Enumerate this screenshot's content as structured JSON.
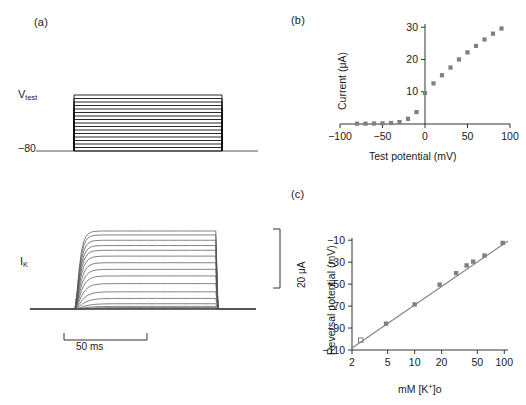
{
  "figure": {
    "panel_a": {
      "label": "(a)",
      "voltage_trace_label_main": "V",
      "voltage_trace_label_sub": "test",
      "holding_label": "−80",
      "current_trace_label_main": "I",
      "current_trace_label_sub": "K",
      "time_scale_label": "50 ms",
      "current_scale_label": "20 μA"
    },
    "panel_b": {
      "label": "(b)"
    },
    "panel_c": {
      "label": "(c)"
    }
  },
  "chart_data": [
    {
      "id": "voltage-protocol",
      "type": "line",
      "title": "Voltage-clamp step protocol",
      "xlabel": "",
      "ylabel": "",
      "holding_potential": -80,
      "n_steps": 17,
      "step_start_mv": -80,
      "step_end_mv": 80,
      "step_increment_mv": 10,
      "ylim": [
        -90,
        90
      ],
      "grid": false,
      "legend": "none"
    },
    {
      "id": "potassium-current-traces",
      "type": "line",
      "title": "Delayed rectifier K+ current families",
      "xlabel": "",
      "ylabel": "",
      "time_scale_bar_ms": 50,
      "current_scale_bar_ua": 20,
      "n_traces": 17,
      "trace_steady_state_ua": [
        0.0,
        0.1,
        0.2,
        0.3,
        0.5,
        1.0,
        2.0,
        4.0,
        6.5,
        9.6,
        12.5,
        15.0,
        17.5,
        20.0,
        22.2,
        24.0,
        26.0,
        28.0,
        29.5
      ],
      "grid": false,
      "legend": "none"
    },
    {
      "id": "current-voltage-relation",
      "type": "scatter",
      "title": "",
      "xlabel": "Test potential (mV)",
      "ylabel": "Current (μA)",
      "xlim": [
        -100,
        100
      ],
      "ylim": [
        0,
        31
      ],
      "xticks": [
        -100,
        -50,
        0,
        50,
        100
      ],
      "xticklabels": [
        "−100",
        "−50",
        "0",
        "50",
        "100"
      ],
      "yticks": [
        10,
        20,
        30
      ],
      "yticklabels": [
        "10",
        "20",
        "30"
      ],
      "grid": false,
      "legend": "none",
      "marker": "filled-square",
      "marker_color": "#808080",
      "x": [
        -80,
        -70,
        -60,
        -50,
        -40,
        -30,
        -20,
        -10,
        0,
        10,
        20,
        30,
        40,
        50,
        60,
        70,
        80,
        90
      ],
      "y": [
        0.1,
        0.1,
        0.15,
        0.2,
        0.3,
        0.6,
        1.6,
        3.7,
        9.6,
        12.6,
        15.1,
        17.5,
        20.0,
        22.2,
        24.2,
        26.2,
        28.0,
        29.6
      ]
    },
    {
      "id": "reversal-potential-vs-potassium",
      "type": "scatter",
      "title": "",
      "xlabel": "mM [K+]o",
      "ylabel": "Reversal potential (mV)",
      "xscale": "log",
      "xlim": [
        2,
        110
      ],
      "ylim": [
        -110,
        -8
      ],
      "xticks": [
        2,
        5,
        10,
        20,
        50,
        100
      ],
      "xticklabels": [
        "2",
        "5",
        "10",
        "20",
        "50",
        "100"
      ],
      "yticks": [
        -10,
        -30,
        -50,
        -70,
        -90,
        -110
      ],
      "yticklabels": [
        "−10",
        "−30",
        "−50",
        "−70",
        "−90",
        "−110"
      ],
      "grid": false,
      "legend": "none",
      "marker": "filled-square",
      "marker_color": "#808080",
      "fit_line": {
        "slope_mv_per_decade": 56,
        "intercept_at_1mM": -125,
        "color": "#808080"
      },
      "x": [
        4.8,
        10.0,
        19.0,
        29.0,
        38.0,
        45.0,
        60.0,
        96.0
      ],
      "y": [
        -86.0,
        -68.5,
        -50.5,
        -40.0,
        -33.0,
        -29.5,
        -24.0,
        -12.5
      ],
      "open_marker": {
        "x": 2.5,
        "y": -101,
        "marker": "open-square",
        "color": "#808080"
      }
    }
  ]
}
